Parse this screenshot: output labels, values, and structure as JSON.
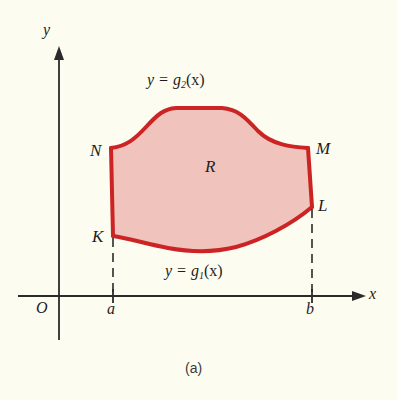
{
  "figure": {
    "caption": "(a)",
    "background_color": "#fdfcf0",
    "region_fill_color": "#f0c3bc",
    "curve_stroke_color": "#cc2424",
    "axis_color": "#2b2b2b"
  },
  "axes": {
    "y_label": "y",
    "x_label": "x",
    "origin_label": "O",
    "x_ticks": [
      {
        "label": "a",
        "x_px": 113
      },
      {
        "label": "b",
        "x_px": 312
      }
    ]
  },
  "region": {
    "name": "R",
    "label": "R"
  },
  "curves": {
    "upper": {
      "label_text": "y = g",
      "label_sub": "2",
      "label_tail": "(x)"
    },
    "lower": {
      "label_text": "y = g",
      "label_sub": "1",
      "label_tail": "(x)"
    }
  },
  "points": [
    {
      "label": "N",
      "role": "upper-left-corner"
    },
    {
      "label": "K",
      "role": "lower-left-corner"
    },
    {
      "label": "M",
      "role": "upper-right-corner"
    },
    {
      "label": "L",
      "role": "lower-right-corner"
    }
  ]
}
